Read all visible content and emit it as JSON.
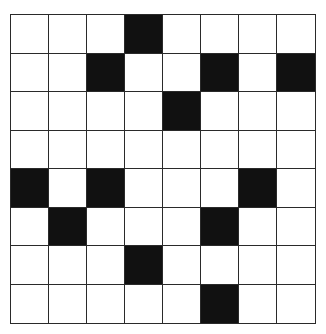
{
  "board": {
    "rows": 8,
    "cols": 8,
    "filled_color": "#111111",
    "empty_color": "#ffffff",
    "grid": [
      [
        0,
        0,
        0,
        1,
        0,
        0,
        0,
        0
      ],
      [
        0,
        0,
        1,
        0,
        0,
        1,
        0,
        1
      ],
      [
        0,
        0,
        0,
        0,
        1,
        0,
        0,
        0
      ],
      [
        0,
        0,
        0,
        0,
        0,
        0,
        0,
        0
      ],
      [
        1,
        0,
        1,
        0,
        0,
        0,
        1,
        0
      ],
      [
        0,
        1,
        0,
        0,
        0,
        1,
        0,
        0
      ],
      [
        0,
        0,
        0,
        1,
        0,
        0,
        0,
        0
      ],
      [
        0,
        0,
        0,
        0,
        0,
        1,
        0,
        0
      ]
    ]
  }
}
